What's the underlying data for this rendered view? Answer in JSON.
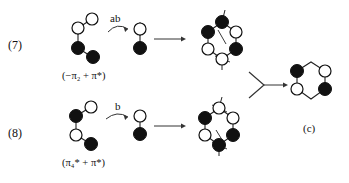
{
  "figure": {
    "type": "chemical-orbital-scheme",
    "background": "#ffffff",
    "ink": "#111111",
    "line_color": "#333333"
  },
  "equations": [
    {
      "id": "7",
      "number_label": "(7)",
      "operator_label": "ab",
      "term_label": "(−π₂ + π*)",
      "term_parts": {
        "open": "(",
        "minus": "−",
        "pi1": "π",
        "sub1": "2",
        "plus": "+",
        "pi2": "π*",
        "close": ")"
      }
    },
    {
      "id": "8",
      "number_label": "(8)",
      "operator_label": "b",
      "term_label": "(π₄* + π*)",
      "term_parts": {
        "open": "(",
        "pi1": "π",
        "sub1": "4",
        "star1": "*",
        "plus": "+",
        "pi2": "π*",
        "close": ")"
      }
    }
  ],
  "product": {
    "label": "(c)"
  },
  "nodes": {
    "filled_color": "#111111",
    "open_fill": "#ffffff",
    "open_stroke": "#111111",
    "radius": 6
  },
  "notes": {
    "row7_reactant": "bent four-node fragment: open, open, filled, filled",
    "row7_intermediate": "two-node vertical fragment: open over filled",
    "row7_hexagon": "six-membered ring with alternating filled/open nodes and phase lobes",
    "row8_reactant": "bent four-node fragment: filled, open, open, filled",
    "row8_intermediate": "two-node vertical fragment: open over filled",
    "row8_hexagon": "six-membered ring with alternating filled/open nodes and phase lobes",
    "product_hexagon": "ring: filled top-left, open top-right, open bottom-left, filled bottom-right"
  }
}
